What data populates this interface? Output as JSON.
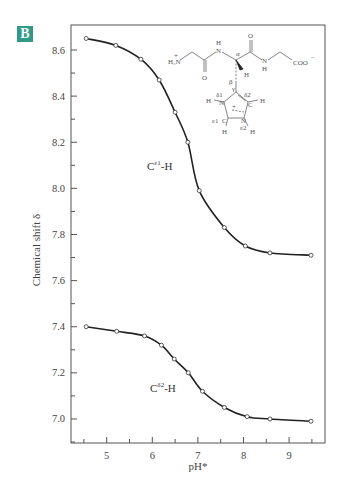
{
  "panel_label": "B",
  "chart_data": {
    "type": "line",
    "title": "",
    "xlabel": "pH*",
    "ylabel": "Chemical shift δ",
    "xlim": [
      4.4,
      9.8
    ],
    "ylim": [
      6.9,
      8.68
    ],
    "x_ticks": [
      5,
      6,
      7,
      8,
      9
    ],
    "y_ticks": [
      "7.0",
      "7.2",
      "7.4",
      "7.6",
      "7.8",
      "8.0",
      "8.2",
      "8.4",
      "8.6"
    ],
    "grid": false,
    "legend": "none (curves labeled inline)",
    "series": [
      {
        "name": "Cε1-H",
        "label_main": "C",
        "label_sup": "ε1",
        "label_tail": "-H",
        "x": [
          4.55,
          5.2,
          5.75,
          6.15,
          6.5,
          6.78,
          7.03,
          7.58,
          8.04,
          8.58,
          9.48
        ],
        "y": [
          8.65,
          8.62,
          8.56,
          8.47,
          8.33,
          8.2,
          7.99,
          7.83,
          7.75,
          7.72,
          7.71
        ]
      },
      {
        "name": "Cδ2-H",
        "label_main": "C",
        "label_sup": "δ2",
        "label_tail": "-H",
        "x": [
          4.55,
          5.22,
          5.83,
          6.2,
          6.48,
          6.79,
          7.1,
          7.58,
          8.08,
          8.58,
          9.48
        ],
        "y": [
          7.4,
          7.38,
          7.36,
          7.32,
          7.26,
          7.2,
          7.12,
          7.05,
          7.01,
          7.0,
          6.99
        ]
      }
    ],
    "annotations": {
      "structure_labels": [
        "H3N+",
        "H",
        "N",
        "O",
        "α",
        "H",
        "N",
        "H",
        "COO−",
        "O",
        "β",
        "γ",
        "H",
        "N",
        "δ1",
        "δ2",
        "C",
        "H",
        "+",
        "ε1",
        "C",
        "N",
        "ε2",
        "H",
        "H"
      ]
    }
  },
  "molecule": {
    "amine": "H₃N",
    "amine_charge": "+",
    "nh1": "H",
    "n1": "N",
    "o1": "O",
    "alpha": "α",
    "alpha_h": "H",
    "o2": "O",
    "n2": "N",
    "nh2": "H",
    "coo": "COO",
    "coo_charge": "−",
    "beta": "β",
    "gamma": "γ",
    "hn_d1": "H",
    "n_d1": "N",
    "d1": "δ1",
    "d2": "δ2",
    "c_d2": "C",
    "h_d2": "H",
    "plus": "+",
    "e1": "ε1",
    "c_e1": "C",
    "n_e2": "N",
    "e2": "ε2",
    "h_e1": "H",
    "h_e2": "H"
  }
}
